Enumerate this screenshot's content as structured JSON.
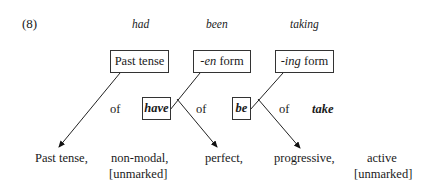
{
  "example_number": "(8)",
  "surface_forms": [
    "had",
    "been",
    "taking"
  ],
  "boxes": {
    "past_tense": "Past tense",
    "en_form_affix": "-en",
    "en_form_word": " form",
    "ing_form_affix": "-ing",
    "ing_form_word": " form",
    "have": "have",
    "be": "be"
  },
  "middle_row": {
    "of_1": "of",
    "of_2": "of",
    "of_3": "of",
    "take": "take"
  },
  "features": [
    {
      "label": "Past tense,",
      "sub": ""
    },
    {
      "label": "non-modal,",
      "sub": "[unmarked]"
    },
    {
      "label": "perfect,",
      "sub": ""
    },
    {
      "label": "progressive,",
      "sub": ""
    },
    {
      "label": "active",
      "sub": "[unmarked]"
    }
  ]
}
